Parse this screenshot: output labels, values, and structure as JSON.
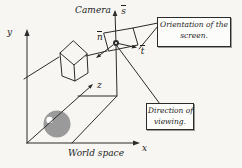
{
  "figure": {
    "camera_label": "Camera",
    "world_label": "World space",
    "axes": {
      "x": "x",
      "y": "y",
      "z": "z"
    },
    "vectors": {
      "s": "s",
      "n": "n",
      "t": "t"
    },
    "callouts": {
      "orientation_line1": "Orientation of the",
      "orientation_line2": "screen.",
      "direction_line1": "Direction of",
      "direction_line2": "viewing."
    },
    "colors": {
      "background": "#f7f6f2",
      "line": "#2b2b2b",
      "sphere": "#9a9a9a",
      "sphere_highlight": "#ffffff",
      "callout_bg": "#fcfcfa"
    }
  }
}
